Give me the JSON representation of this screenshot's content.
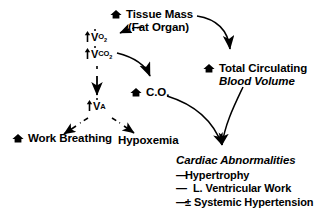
{
  "diagram": {
    "nodes": {
      "tissue_mass": {
        "icon": "up-arrow-icon",
        "line1": "Tissue Mass",
        "line2": "(Fat Organ)"
      },
      "vo2": {
        "increase": "↑",
        "symbol": "V",
        "subscript": "O",
        "subscript_number": "2"
      },
      "vco2": {
        "increase": "↑",
        "symbol": "V",
        "subscript": "CO",
        "subscript_number": "2"
      },
      "va": {
        "increase": "↑",
        "symbol": "V",
        "subscript": "A"
      },
      "cardiac_output": {
        "icon": "up-arrow-icon",
        "label": "C.O."
      },
      "blood_volume": {
        "icon": "up-arrow-icon",
        "line1": "Total Circulating",
        "line2": "Blood Volume"
      },
      "work_breathing": {
        "icon": "up-arrow-icon",
        "label": "Work Breathing"
      },
      "hypoxemia": {
        "label": "Hypoxemia"
      },
      "cardiac_abnormalities": {
        "heading": "Cardiac Abnormalities",
        "items": [
          {
            "marker": "—",
            "gap": false,
            "label": "Hypertrophy"
          },
          {
            "marker": "—",
            "gap": true,
            "label": "L. Ventricular Work"
          },
          {
            "marker": "—",
            "gap": false,
            "label": "± Systemic Hypertension"
          }
        ]
      }
    },
    "edges": [
      {
        "name": "tissue-mass-to-vo2",
        "style": "dashed"
      },
      {
        "name": "tissue-mass-to-blood-volume",
        "style": "solid"
      },
      {
        "name": "vco2-to-cardiac-output",
        "style": "solid"
      },
      {
        "name": "vco2-to-va",
        "style": "dashed"
      },
      {
        "name": "va-to-work-breathing",
        "style": "dashed"
      },
      {
        "name": "va-to-hypoxemia",
        "style": "dashed"
      },
      {
        "name": "cardiac-output-to-cardiac-abnormalities",
        "style": "solid"
      },
      {
        "name": "blood-volume-to-cardiac-abnormalities",
        "style": "solid"
      }
    ],
    "colors": {
      "ink": "#000000",
      "background": "#ffffff"
    }
  }
}
